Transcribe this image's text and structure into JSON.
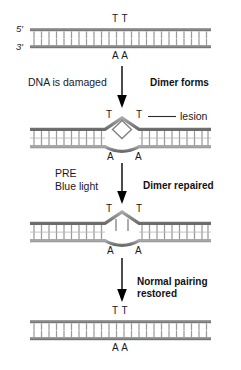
{
  "figure": {
    "type": "process-diagram",
    "panel_count": 4,
    "step_count": 3
  },
  "colors": {
    "backbone": "#8c8c8c",
    "backbone_dark": "#6e6e6e",
    "rung": "#9a9a9a",
    "text": "#1a1a1a",
    "arrow": "#000000",
    "background": "#ffffff"
  },
  "panels": [
    {
      "id": "panel-normal-dna",
      "name": "Normal DNA duplex",
      "top_label": "T T",
      "bottom_label": "A A",
      "left_end_labels": {
        "top": "5′",
        "bottom": "3′"
      },
      "state": "intact",
      "lesion_label": null
    },
    {
      "id": "panel-dimer-formed",
      "name": "DNA with thymine dimer lesion",
      "top_label_left": "T",
      "top_label_right": "T",
      "bottom_label_left": "A",
      "bottom_label_right": "A",
      "left_end_labels": {
        "top": "",
        "bottom": ""
      },
      "state": "dimer",
      "lesion_label": "lesion"
    },
    {
      "id": "panel-dimer-repaired",
      "name": "Dimer bonds broken, distortion remains",
      "top_label_left": "T",
      "top_label_right": "T",
      "bottom_label_left": "A",
      "bottom_label_right": "A",
      "left_end_labels": {
        "top": "",
        "bottom": ""
      },
      "state": "repaired-distorted",
      "lesion_label": null
    },
    {
      "id": "panel-restored",
      "name": "Restored normal DNA duplex",
      "top_label": "T T",
      "bottom_label": "A A",
      "left_end_labels": {
        "top": "",
        "bottom": ""
      },
      "state": "intact",
      "lesion_label": null
    }
  ],
  "steps": [
    {
      "id": "step-1",
      "left_lines": [
        "DNA is damaged"
      ],
      "right_lines": [
        "Dimer forms"
      ],
      "left_style": "plain",
      "right_style": "bold"
    },
    {
      "id": "step-2",
      "left_lines": [
        "PRE",
        "Blue light"
      ],
      "right_lines": [
        "Dimer repaired"
      ],
      "left_style": "plain",
      "right_style": "bold"
    },
    {
      "id": "step-3",
      "left_lines": [],
      "right_lines": [
        "Normal pairing",
        "restored"
      ],
      "left_style": "plain",
      "right_style": "bold"
    }
  ]
}
